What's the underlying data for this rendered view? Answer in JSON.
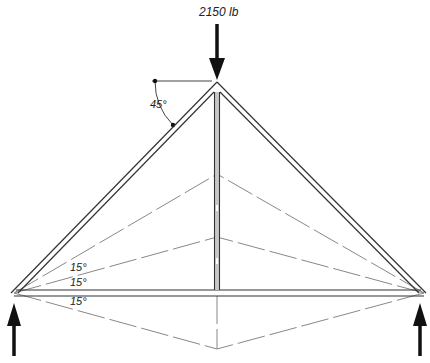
{
  "diagram": {
    "load": {
      "label": "2150 lb",
      "direction": "down"
    },
    "angles": {
      "apex_angle": "45°",
      "upper_15": "15°",
      "middle_15": "15°",
      "lower_15": "15°"
    },
    "reactions": {
      "left": "up",
      "right": "up"
    },
    "colors": {
      "member": "#333333",
      "member_fill": "#bbbbbb",
      "dash": "#888888",
      "arrow": "#111111"
    }
  }
}
